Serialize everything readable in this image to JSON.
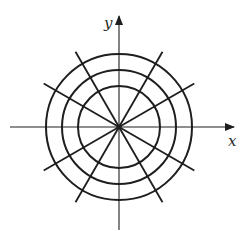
{
  "diagram": {
    "center": [
      119,
      127
    ],
    "axes": {
      "x": {
        "label": "x",
        "from": 10,
        "to": 234
      },
      "y": {
        "label": "y",
        "from": 230,
        "to": 16
      }
    },
    "circles": [
      {
        "radius": 41
      },
      {
        "radius": 57
      },
      {
        "radius": 73
      }
    ],
    "radial_lines": {
      "angles_deg": [
        30,
        60,
        120,
        150,
        210,
        240,
        300,
        330
      ],
      "length": 87
    },
    "colors": {
      "stroke": "#1e1e1e",
      "background": "#ffffff"
    }
  }
}
